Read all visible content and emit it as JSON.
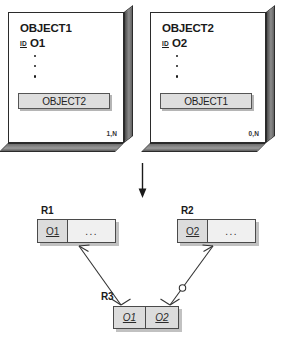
{
  "diagram": {
    "colors": {
      "ink": "#1a1a1a",
      "box_fill": "#ffffff",
      "box_border": "#2b2b2b",
      "attr_fill": "#dedede",
      "key_cell_fill": "#dcdcdc",
      "rest_cell_fill": "#f0f0f0",
      "shadow": "#a0a0a0"
    },
    "object_boxes": [
      {
        "name": "OBJECT1",
        "id_tag": "ID",
        "id_value": "O1",
        "dots": [
          "•",
          "•",
          "•"
        ],
        "reference_attribute": "OBJECT2",
        "cardinality": "1,N"
      },
      {
        "name": "OBJECT2",
        "id_tag": "ID",
        "id_value": "O2",
        "dots": [
          "•",
          "•",
          "•"
        ],
        "reference_attribute": "OBJECT1",
        "cardinality": "0,N"
      }
    ],
    "transform_arrow": {
      "direction": "down",
      "label": ""
    },
    "relations": [
      {
        "label": "R1",
        "key": "O1",
        "rest": "...",
        "key_italic": false
      },
      {
        "label": "R2",
        "key": "O2",
        "rest": "...",
        "key_italic": false
      },
      {
        "label": "R3",
        "key": "O1",
        "key2": "O2",
        "key_italic": true
      }
    ],
    "connectors": [
      {
        "from": "R3",
        "to": "R1",
        "source_end": "crows-foot",
        "target_end": "crows-foot",
        "optional_marker": false
      },
      {
        "from": "R3",
        "to": "R2",
        "source_end": "crows-foot",
        "target_end": "crows-foot",
        "optional_marker": true
      }
    ]
  }
}
